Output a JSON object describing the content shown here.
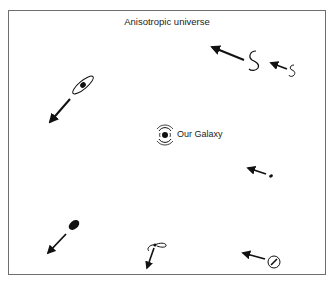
{
  "title": "Anisotropic universe",
  "galaxy_label": "Our Galaxy",
  "colors": {
    "ink": "#111111",
    "frame": "#6e6e6e",
    "background": "#ffffff"
  },
  "galaxies": [
    {
      "id": "spiral-upper-right",
      "shape": "spiral",
      "arrow_direction": "up-left"
    },
    {
      "id": "spiral-small-far-right",
      "shape": "spiral-small",
      "arrow_direction": "up-left"
    },
    {
      "id": "edge-on-upper-left",
      "shape": "ring-with-core",
      "arrow_direction": "down-left"
    },
    {
      "id": "small-right",
      "shape": "small-ellipse",
      "arrow_direction": "up-left"
    },
    {
      "id": "elliptical-lower-left",
      "shape": "filled-ellipse",
      "arrow_direction": "down-left"
    },
    {
      "id": "spiral-lower-middle",
      "shape": "spiral-ring",
      "arrow_direction": "down"
    },
    {
      "id": "face-on-lower-right",
      "shape": "circle-with-core",
      "arrow_direction": "left"
    }
  ]
}
